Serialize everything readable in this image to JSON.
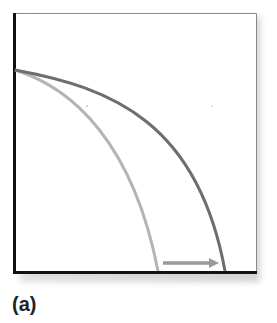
{
  "figure": {
    "panel_label": "(a)",
    "top_text_fragment": "",
    "colors": {
      "axis": "#111111",
      "frame_top_right": "#888888",
      "original_curve": "#b4b4b4",
      "shifted_curve": "#6e6e6e",
      "arrow": "#9a9a9a",
      "shadow": "#cccccc"
    },
    "curves": [
      {
        "name": "original-curve",
        "description": "inner concave curve (lighter gray)",
        "start": [
          0,
          57
        ],
        "end": [
          145,
          259
        ]
      },
      {
        "name": "shifted-curve",
        "description": "outer concave curve (darker gray) shifted right",
        "start": [
          0,
          57
        ],
        "end": [
          212,
          259
        ]
      }
    ],
    "arrow": {
      "direction": "right",
      "from_x": 150,
      "to_x": 205,
      "y": 250
    }
  }
}
